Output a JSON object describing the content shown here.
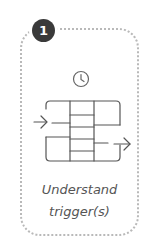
{
  "step": {
    "number": "1",
    "caption_line1": "Understand",
    "caption_line2": "trigger(s)",
    "icons": [
      "clock-icon",
      "trigger-grid-icon"
    ],
    "colors": {
      "badge": "#3a3a3a",
      "border": "#b9b9b9",
      "icon_stroke": "#555555",
      "text": "#555555"
    }
  }
}
